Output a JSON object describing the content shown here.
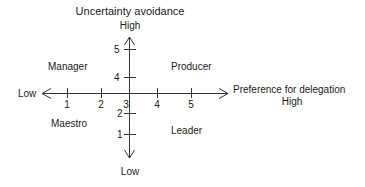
{
  "diagram": {
    "y_axis": {
      "title": "Uncertainty avoidance",
      "high_label": "High",
      "low_label": "Low",
      "ticks": [
        "5",
        "4",
        "2",
        "1"
      ]
    },
    "x_axis": {
      "title": "Preference for delegation",
      "high_label": "High",
      "low_label": "Low",
      "ticks": [
        "1",
        "2",
        "3",
        "4",
        "5"
      ]
    },
    "quadrants": {
      "top_left": "Manager",
      "top_right": "Producer",
      "bottom_left": "Maestro",
      "bottom_right": "Leader"
    },
    "colors": {
      "line": "#333333",
      "text": "#1a1a1a"
    }
  }
}
